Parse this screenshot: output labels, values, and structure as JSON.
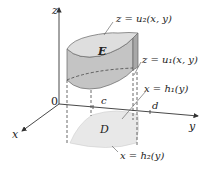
{
  "figure": {
    "type": "3d-region-diagram",
    "axes": {
      "z_label": "z",
      "x_label": "x",
      "y_label": "y",
      "origin_label": "0"
    },
    "solid": {
      "label": "E",
      "top_surface": "z = u₂(x, y)",
      "bottom_surface": "z = u₁(x, y)"
    },
    "region": {
      "label": "D",
      "boundary_1": "x = h₁(y)",
      "boundary_2": "x = h₂(y)",
      "y_min_label": "c",
      "y_max_label": "d"
    },
    "colors": {
      "solid_fill": "#c9c9c9",
      "solid_top": "#dcdcdc",
      "solid_side_dark": "#b5b5b5",
      "region_fill": "#e6e6e6",
      "axis": "#333333",
      "dashed": "#444444"
    }
  }
}
